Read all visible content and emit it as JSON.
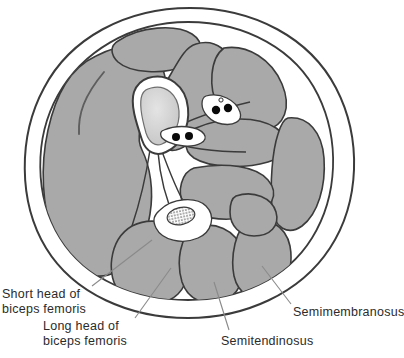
{
  "figure": {
    "kind": "anatomical-cross-section",
    "region": "thigh",
    "view": "transverse-section",
    "title": ""
  },
  "labels": [
    {
      "id": "short-head-biceps-femoris",
      "line1": "Short head of",
      "line2": "biceps femoris"
    },
    {
      "id": "long-head-biceps-femoris",
      "line1": "Long head of",
      "line2": "biceps femoris"
    },
    {
      "id": "semitendinosus",
      "line1": "Semitendinosus",
      "line2": ""
    },
    {
      "id": "semimembranosus",
      "line1": "Semimembranosus",
      "line2": ""
    }
  ],
  "colors": {
    "muscle_fill": "#a9a9a9",
    "muscle_fill_alt": "#adadad",
    "fascia_white": "#ffffff",
    "outline": "#3b3b3b",
    "outline_soft": "#6e6e6e",
    "bone_marrow": "#d0d0d0",
    "vessel_black": "#0a0a0a",
    "nerve_stipple": "#6a6a6a",
    "text": "#2b2b2b",
    "background": "#ffffff"
  },
  "structures": {
    "bone": "femur",
    "nerve": "sciatic-nerve",
    "vessel_bundles": 2,
    "vessel_dots_upper": 2,
    "vessel_dots_lower": 2
  }
}
